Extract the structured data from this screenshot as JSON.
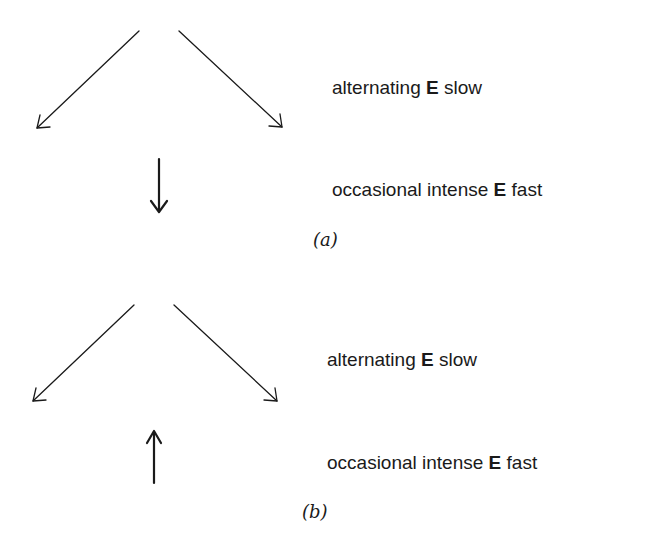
{
  "panels": [
    {
      "id": "a",
      "caption": "(a)",
      "lines": [
        {
          "pre": "alternating ",
          "bold": "E",
          "post": " slow"
        },
        {
          "pre": "occasional intense ",
          "bold": "E",
          "post": " fast"
        }
      ],
      "arrows": {
        "diagonal_left": "down-left",
        "diagonal_right": "down-right",
        "vertical": "down"
      }
    },
    {
      "id": "b",
      "caption": "(b)",
      "lines": [
        {
          "pre": "alternating ",
          "bold": "E",
          "post": " slow"
        },
        {
          "pre": "occasional intense ",
          "bold": "E",
          "post": " fast"
        }
      ],
      "arrows": {
        "diagonal_left": "down-left",
        "diagonal_right": "down-right",
        "vertical": "up"
      }
    }
  ],
  "colors": {
    "ink": "#1a1a1a",
    "background": "#ffffff"
  }
}
